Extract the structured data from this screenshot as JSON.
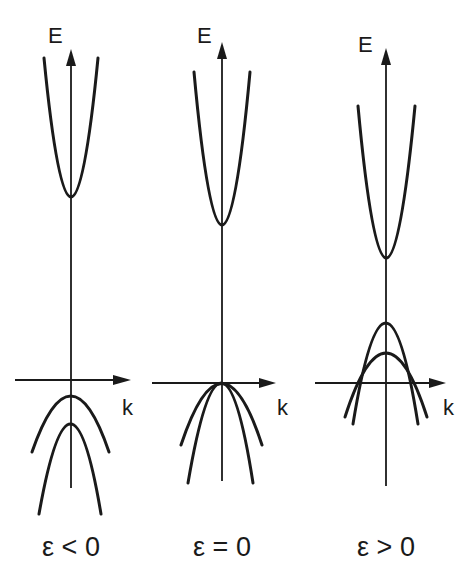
{
  "figure": {
    "colors": {
      "ink": "#1a1a1a",
      "background": "#ffffff"
    },
    "panels": [
      {
        "id": "negative",
        "y_axis_label": "E",
        "x_axis_label": "k",
        "caption": "ε < 0",
        "bands": [
          "conduction band (upward parabola)",
          "upper valence band (wide, below k-axis)",
          "lower valence band (narrow, further below)"
        ]
      },
      {
        "id": "zero",
        "y_axis_label": "E",
        "x_axis_label": "k",
        "caption": "ε = 0",
        "bands": [
          "conduction band (upward parabola)",
          "degenerate valence bands touching at k=0 on the k-axis (wide and narrow)"
        ]
      },
      {
        "id": "positive",
        "y_axis_label": "E",
        "x_axis_label": "k",
        "caption": "ε > 0",
        "bands": [
          "conduction band (upward parabola, raised)",
          "narrow valence band (above k-axis, higher vertex)",
          "wide valence band (above k-axis, lower vertex), crossing the narrow band"
        ]
      }
    ]
  }
}
